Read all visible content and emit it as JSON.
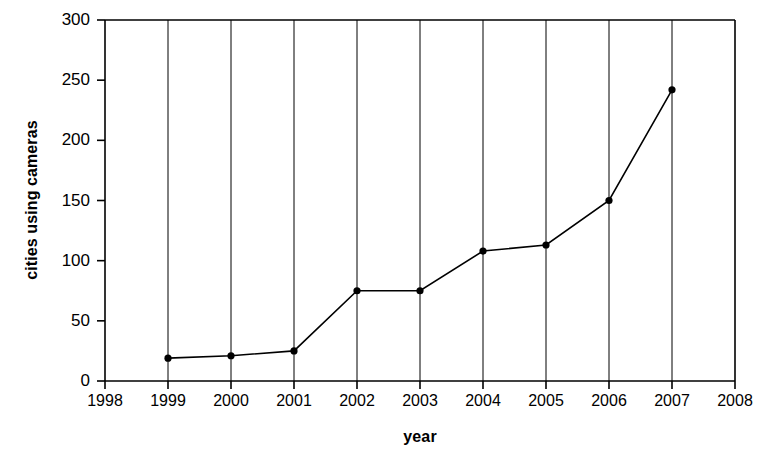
{
  "chart_data": {
    "type": "line",
    "title": "",
    "xlabel": "year",
    "ylabel": "cities using cameras",
    "x": [
      1999,
      2000,
      2001,
      2002,
      2003,
      2004,
      2005,
      2006,
      2007
    ],
    "values": [
      19,
      21,
      25,
      75,
      75,
      108,
      113,
      150,
      242
    ],
    "series": [
      {
        "name": "cities using cameras",
        "x": [
          1999,
          2000,
          2001,
          2002,
          2003,
          2004,
          2005,
          2006,
          2007
        ],
        "values": [
          19,
          21,
          25,
          75,
          75,
          108,
          113,
          150,
          242
        ]
      }
    ],
    "xlim": [
      1998,
      2008
    ],
    "ylim": [
      0,
      300
    ],
    "xticks": [
      1998,
      1999,
      2000,
      2001,
      2002,
      2003,
      2004,
      2005,
      2006,
      2007,
      2008
    ],
    "xtick_labels": [
      "1998",
      "1999",
      "2000",
      "2001",
      "2002",
      "2003",
      "2004",
      "2005",
      "2006",
      "2007",
      "2008"
    ],
    "yticks": [
      0,
      50,
      100,
      150,
      200,
      250,
      300
    ],
    "ytick_labels": [
      "0",
      "50",
      "100",
      "150",
      "200",
      "250",
      "300"
    ],
    "grid": "vertical",
    "legend": "none",
    "marker": "filled-circle",
    "line_color": "#000000",
    "marker_color": "#000000",
    "grid_color": "#000000",
    "axis_color": "#000000",
    "background_color": "#ffffff"
  }
}
